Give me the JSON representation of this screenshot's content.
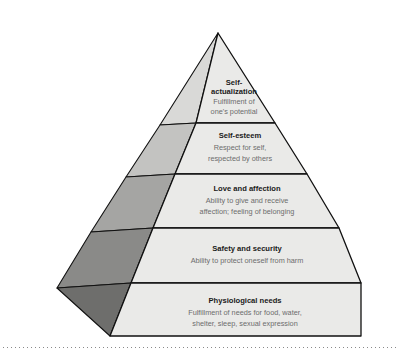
{
  "diagram": {
    "type": "pyramid-hierarchy",
    "name": "Maslow's hierarchy of needs pyramid",
    "colors": {
      "front_face": "#e9e9e7",
      "outline": "#111111",
      "title_text": "#1a1a1a",
      "description_text": "#6d6d6d",
      "side_panel_1": "#d8d8d6",
      "side_panel_2": "#bdbdbb",
      "side_panel_3": "#a3a3a1",
      "side_panel_4": "#8b8b89",
      "side_panel_5": "#6f6f6d",
      "background": "#ffffff"
    },
    "tiers": [
      {
        "level": 1,
        "position": "top",
        "title": "Self-",
        "title_line2": "actualization",
        "description_lines": [
          "Fulfillment of",
          "one's potential"
        ]
      },
      {
        "level": 2,
        "position": "second",
        "title": "Self-esteem",
        "title_line2": "",
        "description_lines": [
          "Respect for self,",
          "respected by others"
        ]
      },
      {
        "level": 3,
        "position": "middle",
        "title": "Love and affection",
        "title_line2": "",
        "description_lines": [
          "Ability to give and receive",
          "affection; feeling of belonging"
        ]
      },
      {
        "level": 4,
        "position": "fourth",
        "title": "Safety and security",
        "title_line2": "",
        "description_lines": [
          "Ability to protect oneself from harm"
        ]
      },
      {
        "level": 5,
        "position": "base",
        "title": "Physiological needs",
        "title_line2": "",
        "description_lines": [
          "Fulfillment of needs for food, water,",
          "shelter, sleep, sexual expression"
        ]
      }
    ]
  }
}
